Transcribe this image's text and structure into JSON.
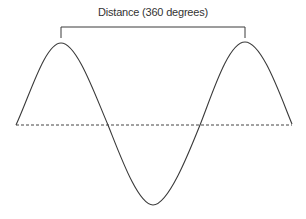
{
  "diagram": {
    "label": "Distance (360 degrees)",
    "colors": {
      "stroke": "#3a3a3a",
      "text": "#333333"
    }
  }
}
